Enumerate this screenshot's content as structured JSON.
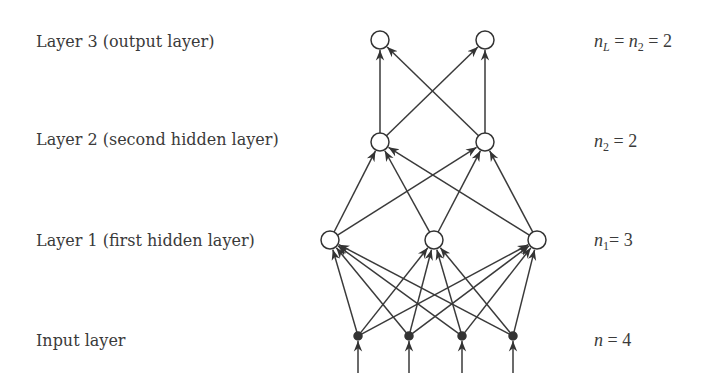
{
  "diagram": {
    "type": "feedforward-neural-network",
    "layers": [
      {
        "id": "layer3",
        "label": "Layer 3 (output layer)",
        "equation": {
          "lhs": "n",
          "lhs_sub": "L",
          "mid": "n",
          "mid_sub": "2",
          "value": "2"
        },
        "nodes": 2
      },
      {
        "id": "layer2",
        "label": "Layer 2 (second hidden layer)",
        "equation": {
          "lhs": "n",
          "lhs_sub": "2",
          "value": "2"
        },
        "nodes": 2
      },
      {
        "id": "layer1",
        "label": "Layer 1 (first hidden layer)",
        "equation": {
          "lhs": "n",
          "lhs_sub": "1",
          "value": "3"
        },
        "nodes": 3
      },
      {
        "id": "input",
        "label": "Input layer",
        "equation": {
          "lhs": "n",
          "value": "4"
        },
        "nodes": 4
      }
    ],
    "connectivity": "fully-connected",
    "colors": {
      "stroke": "#333333",
      "text": "#3a3a3a",
      "input_node_fill": "#333333",
      "node_fill": "#ffffff"
    }
  },
  "labels": {
    "layer3": "Layer 3 (output layer)",
    "layer2": "Layer 2 (second hidden layer)",
    "layer1": "Layer 1 (first hidden layer)",
    "input": "Input layer"
  },
  "equations": {
    "layer3": {
      "n": "n",
      "sub_l": "L",
      "eq1": " = ",
      "n2": "n",
      "sub_2": "2",
      "eq2": " = ",
      "val": "2"
    },
    "layer2": {
      "n": "n",
      "sub": "2",
      "eq": " = ",
      "val": "2"
    },
    "layer1": {
      "n": "n",
      "sub": "1",
      "eq": "= ",
      "val": "3"
    },
    "input": {
      "n": "n",
      "eq": " = ",
      "val": "4"
    }
  }
}
